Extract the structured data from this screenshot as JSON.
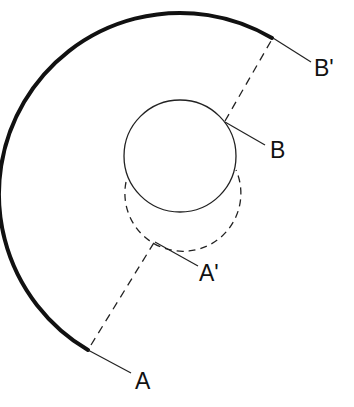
{
  "diagram": {
    "type": "geometric-construction",
    "colors": {
      "background": "#ffffff",
      "stroke": "#111111"
    },
    "labels": {
      "A": "A",
      "A_prime": "A'",
      "B": "B",
      "B_prime": "B'"
    },
    "elements": {
      "outer_arc": {
        "style": "solid-thick",
        "start_point": "A",
        "end_point": "B'"
      },
      "inner_circle": {
        "style": "solid-thin",
        "center": [
          180,
          156
        ],
        "radius": 56
      },
      "displaced_circle": {
        "style": "dashed",
        "center": [
          183,
          190
        ],
        "radius": 58
      },
      "chord_lower": {
        "style": "dashed",
        "from": "A",
        "to": "A'"
      },
      "chord_upper": {
        "style": "dashed",
        "from": "B",
        "to": "B'"
      }
    },
    "points": {
      "A": [
        88,
        350
      ],
      "A_prime": [
        155,
        240
      ],
      "B": [
        225,
        121
      ],
      "B_prime": [
        272,
        38
      ]
    }
  }
}
